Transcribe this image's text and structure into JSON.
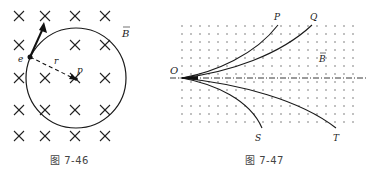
{
  "figures": [
    {
      "id": "left",
      "caption": "图 7-46",
      "labels": {
        "electron": "e",
        "radius": "r",
        "center": "p",
        "field": "B"
      },
      "field_symbol": "×",
      "colors": {
        "ink": "#1a1a1a",
        "caption": "#444444"
      }
    },
    {
      "id": "right",
      "caption": "图 7-47",
      "labels": {
        "origin": "O",
        "track1": "P",
        "track2": "Q",
        "track3": "S",
        "track4": "T",
        "field": "B"
      },
      "field_symbol": "·",
      "colors": {
        "ink": "#1a1a1a",
        "dots": "#555555",
        "caption": "#444444"
      }
    }
  ]
}
